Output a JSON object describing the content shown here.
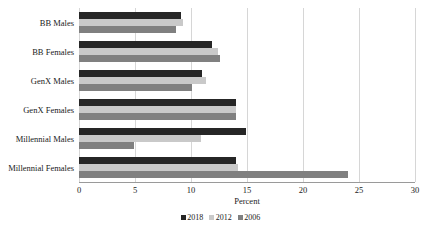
{
  "chart_data": {
    "type": "bar",
    "orientation": "horizontal",
    "title": "",
    "xlabel": "Percent",
    "ylabel": "",
    "xlim": [
      0,
      30
    ],
    "xticks": [
      0,
      5,
      10,
      15,
      20,
      25,
      30
    ],
    "xtick_labels": [
      "0",
      "5",
      "10",
      "15",
      "20",
      "25",
      "30"
    ],
    "grid": true,
    "legend_position": "bottom",
    "categories": [
      "BB Males",
      "BB Females",
      "GenX Males",
      "GenX Females",
      "Millennial Males",
      "Millennial Females"
    ],
    "series": [
      {
        "name": "2018",
        "color": "#262626",
        "values": [
          9.1,
          11.9,
          11.0,
          14.0,
          14.9,
          14.0
        ]
      },
      {
        "name": "2012",
        "color": "#c9c9c9",
        "values": [
          9.3,
          12.4,
          11.3,
          14.0,
          10.9,
          14.2
        ]
      },
      {
        "name": "2006",
        "color": "#808080",
        "values": [
          8.7,
          12.6,
          10.1,
          14.0,
          4.9,
          24.0
        ]
      }
    ],
    "legend": [
      {
        "label": "2018",
        "color": "#262626"
      },
      {
        "label": "2012",
        "color": "#c9c9c9"
      },
      {
        "label": "2006",
        "color": "#808080"
      }
    ]
  }
}
